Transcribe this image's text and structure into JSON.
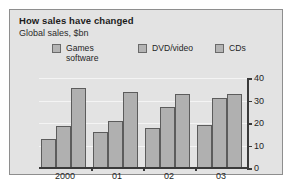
{
  "chart_data": {
    "type": "bar",
    "title": "How sales have changed",
    "subtitle": "Global sales, $bn",
    "xlabel": "",
    "ylabel": "",
    "ylim": [
      0,
      40
    ],
    "yticks": [
      0,
      10,
      20,
      30,
      40
    ],
    "grid": true,
    "legend_position": "top",
    "categories": [
      "2000",
      "01",
      "02",
      "03"
    ],
    "series": [
      {
        "name": "Games\nsoftware",
        "values": [
          13,
          16,
          18,
          19
        ]
      },
      {
        "name": "DVD/video",
        "values": [
          18.5,
          21,
          27,
          31
        ]
      },
      {
        "name": "CDs",
        "values": [
          35.5,
          34,
          33,
          33
        ]
      }
    ],
    "colors": {
      "bar_fill": "#b0b0b0",
      "bar_edge": "#5c5c5c",
      "panel_background": "#e3e3e3",
      "panel_border": "#8e8e8e",
      "axis": "#3a3a3a",
      "gridline": "#f4f4f4",
      "text": "#1f1f1f"
    }
  }
}
